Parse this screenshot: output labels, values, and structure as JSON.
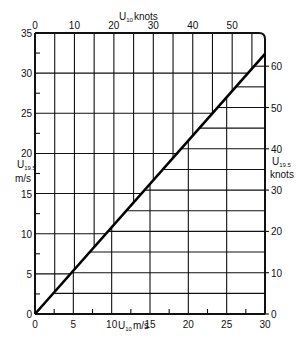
{
  "chart_data": {
    "type": "line",
    "title": "",
    "xlabel": "U10 m/s",
    "ylabel": "U19.5 m/s",
    "x2label": "U10 knots",
    "y2label": "U19.5 knots",
    "xlim": [
      0,
      30
    ],
    "ylim": [
      0,
      35
    ],
    "x2lim": [
      0,
      58.3
    ],
    "y2lim": [
      0,
      68
    ],
    "grid": true,
    "x_ticks": [
      0,
      5,
      10,
      15,
      20,
      25,
      30
    ],
    "x_tick_labels": [
      "0",
      "5",
      "10",
      "15",
      "20",
      "25",
      "30"
    ],
    "y_ticks": [
      0,
      5,
      10,
      15,
      20,
      25,
      30,
      35
    ],
    "y_tick_labels": [
      "0",
      "5",
      "10",
      "15",
      "20",
      "25",
      "30",
      "35"
    ],
    "x2_ticks": [
      0,
      10,
      20,
      30,
      40,
      50
    ],
    "x2_tick_labels": [
      "0",
      "10",
      "20",
      "30",
      "40",
      "50"
    ],
    "y2_ticks": [
      0,
      10,
      20,
      30,
      40,
      50,
      60
    ],
    "y2_tick_labels": [
      "0",
      "10",
      "20",
      "30",
      "40",
      "50",
      "60"
    ],
    "series": [
      {
        "name": "U19.5 vs U10",
        "x": [
          0,
          30
        ],
        "y": [
          0,
          32.4
        ]
      }
    ],
    "relation": "U19.5 = 1.08 × U10"
  },
  "labels": {
    "top_axis_main": "U",
    "top_axis_sub": "10",
    "top_axis_unit": "knots",
    "left_axis_main": "U",
    "left_axis_sub": "19.5",
    "left_axis_unit": "m/s",
    "right_axis_main": "U",
    "right_axis_sub": "19.5",
    "right_axis_unit": "knots",
    "bottom_axis_main": "U",
    "bottom_axis_sub": "10",
    "bottom_axis_unit": "m/s"
  }
}
